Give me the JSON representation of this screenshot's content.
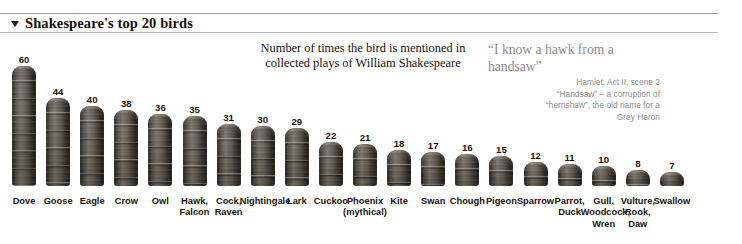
{
  "header": {
    "title": "Shakespeare's top 20 birds",
    "triangle_icon": "triangle-down-icon"
  },
  "subtitle": "Number of times the bird is mentioned in collected plays of William Shakespeare",
  "quote": {
    "text": "“I know a hawk from a handsaw”",
    "attribution_lines": [
      "Hamlet, Act II, scene 2",
      "“Handsaw” – a corruption of",
      "“hernshaw”, the old name for a",
      "Grey Heron"
    ]
  },
  "colors": {
    "bar_dark": "#1d1a17",
    "bar_mid": "#6d655a",
    "text": "#1a120c",
    "quote_grey": "#8d8d8d",
    "rule": "#9a9a9a"
  },
  "chart_data": {
    "type": "bar",
    "title": "Shakespeare's top 20 birds",
    "subtitle": "Number of times the bird is mentioned in collected plays of William Shakespeare",
    "xlabel": "",
    "ylabel": "Number of mentions",
    "ylim": [
      0,
      60
    ],
    "grid": false,
    "legend": "none",
    "categories": [
      "Dove",
      "Goose",
      "Eagle",
      "Crow",
      "Owl",
      "Hawk, Falcon",
      "Cock, Raven",
      "Nightingale",
      "Lark",
      "Cuckoo",
      "Phoenix (mythical)",
      "Kite",
      "Swan",
      "Chough",
      "Pigeon",
      "Sparrow",
      "Parrot, Duck",
      "Gull, Woodcock, Wren",
      "Vulture, Rook, Daw",
      "Swallow"
    ],
    "values": [
      60,
      44,
      40,
      38,
      36,
      35,
      31,
      30,
      29,
      22,
      21,
      18,
      17,
      16,
      15,
      12,
      11,
      10,
      8,
      7
    ],
    "bars": [
      {
        "label_lines": [
          "Dove"
        ],
        "value": 60
      },
      {
        "label_lines": [
          "Goose"
        ],
        "value": 44
      },
      {
        "label_lines": [
          "Eagle"
        ],
        "value": 40
      },
      {
        "label_lines": [
          "Crow"
        ],
        "value": 38
      },
      {
        "label_lines": [
          "Owl"
        ],
        "value": 36
      },
      {
        "label_lines": [
          "Hawk,",
          "Falcon"
        ],
        "value": 35
      },
      {
        "label_lines": [
          "Cock,",
          "Raven"
        ],
        "value": 31
      },
      {
        "label_lines": [
          "Nightingale"
        ],
        "value": 30
      },
      {
        "label_lines": [
          "Lark"
        ],
        "value": 29
      },
      {
        "label_lines": [
          "Cuckoo"
        ],
        "value": 22
      },
      {
        "label_lines": [
          "Phoenix",
          "(mythical)"
        ],
        "value": 21
      },
      {
        "label_lines": [
          "Kite"
        ],
        "value": 18
      },
      {
        "label_lines": [
          "Swan"
        ],
        "value": 17
      },
      {
        "label_lines": [
          "Chough"
        ],
        "value": 16
      },
      {
        "label_lines": [
          "Pigeon"
        ],
        "value": 15
      },
      {
        "label_lines": [
          "Sparrow"
        ],
        "value": 12
      },
      {
        "label_lines": [
          "Parrot,",
          "Duck"
        ],
        "value": 11
      },
      {
        "label_lines": [
          "Gull,",
          "Woodcock,",
          "Wren"
        ],
        "value": 10
      },
      {
        "label_lines": [
          "Vulture,",
          "Rook,",
          "Daw"
        ],
        "value": 8
      },
      {
        "label_lines": [
          "Swallow"
        ],
        "value": 7
      }
    ]
  }
}
